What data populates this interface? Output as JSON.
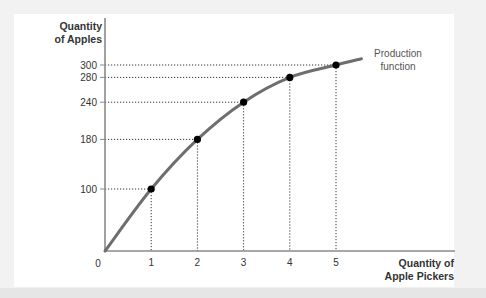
{
  "chart_data": {
    "type": "line",
    "title": "",
    "xlabel": [
      "Quantity of",
      "Apple Pickers"
    ],
    "ylabel": [
      "Quantity",
      "of Apples"
    ],
    "x": [
      0,
      1,
      2,
      3,
      4,
      5
    ],
    "series": [
      {
        "name": "Production function",
        "values": [
          0,
          100,
          180,
          240,
          280,
          300
        ],
        "marked_points": [
          1,
          2,
          3,
          4,
          5
        ]
      }
    ],
    "curve_extends_to_x": 5.55,
    "curve_end_value": 310,
    "xticks": [
      1,
      2,
      3,
      4,
      5
    ],
    "yticks": [
      100,
      180,
      240,
      280,
      300
    ],
    "origin_label": "0",
    "xlim": [
      0,
      6.2
    ],
    "ylim": [
      0,
      300
    ],
    "grid": false,
    "dotted_guides": true,
    "legend": "none",
    "annotations": [
      {
        "text": [
          "Production",
          "function"
        ],
        "position": "right of curve end"
      }
    ],
    "colors": {
      "curve": "#6e6e6e",
      "points": "#000000",
      "axis": "#8a8a8a",
      "guides": "#333333",
      "panel": "#ffffff",
      "background": "#f2f2f2",
      "text": "#333333"
    }
  }
}
